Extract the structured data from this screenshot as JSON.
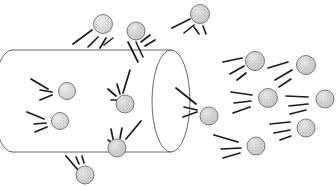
{
  "figure": {
    "canvas": {
      "width": 336,
      "height": 191,
      "background": "#ffffff"
    },
    "colors": {
      "background": "#ffffff",
      "outline": "#555555",
      "stroke": "#1a1a1a",
      "particle_fill": "#d8d8d8",
      "particle_fill_dark": "#c9c9c9",
      "particle_outline": "#555555"
    }
  },
  "cylinder": {
    "name": "cylinder",
    "left_x": 12,
    "right_x": 171,
    "top_y": 50,
    "bottom_y": 152,
    "cap_rx": 19,
    "cap_ry": 51,
    "left_cap_style": "partial-arc",
    "right_cap_style": "full-ellipse",
    "stroke_width": 0.9
  },
  "particles": [
    {
      "id": "p01",
      "cx": 103,
      "cy": 24,
      "r": 9.5,
      "region": "outside-top",
      "shade": "light"
    },
    {
      "id": "p02",
      "cx": 136,
      "cy": 31,
      "r": 9.0,
      "region": "outside-top",
      "shade": "dark"
    },
    {
      "id": "p03",
      "cx": 200,
      "cy": 14,
      "r": 9.5,
      "region": "outside-top",
      "shade": "dark"
    },
    {
      "id": "p04",
      "cx": 67,
      "cy": 91,
      "r": 8.5,
      "region": "inside",
      "shade": "light"
    },
    {
      "id": "p05",
      "cx": 60,
      "cy": 121,
      "r": 8.5,
      "region": "inside",
      "shade": "light"
    },
    {
      "id": "p06",
      "cx": 125,
      "cy": 104,
      "r": 9.0,
      "region": "inside",
      "shade": "dark"
    },
    {
      "id": "p07",
      "cx": 117,
      "cy": 148,
      "r": 9.0,
      "region": "inside",
      "shade": "dark"
    },
    {
      "id": "p08",
      "cx": 85,
      "cy": 175,
      "r": 9.0,
      "region": "outside-bottom",
      "shade": "dark"
    },
    {
      "id": "p09",
      "cx": 209,
      "cy": 116,
      "r": 9.0,
      "region": "outside-right",
      "shade": "dark"
    },
    {
      "id": "p10",
      "cx": 255,
      "cy": 61,
      "r": 9.5,
      "region": "outside-right",
      "shade": "dark"
    },
    {
      "id": "p11",
      "cx": 306,
      "cy": 65,
      "r": 9.5,
      "region": "outside-right",
      "shade": "dark"
    },
    {
      "id": "p12",
      "cx": 268,
      "cy": 98,
      "r": 9.5,
      "region": "outside-right",
      "shade": "dark"
    },
    {
      "id": "p13",
      "cx": 325,
      "cy": 99,
      "r": 9.0,
      "region": "outside-right",
      "shade": "dark"
    },
    {
      "id": "p14",
      "cx": 306,
      "cy": 128,
      "r": 9.0,
      "region": "outside-right",
      "shade": "dark"
    },
    {
      "id": "p15",
      "cx": 256,
      "cy": 146,
      "r": 9.0,
      "region": "outside-right",
      "shade": "dark"
    }
  ],
  "motion_strokes": [
    {
      "x1": 73,
      "y1": 44,
      "x2": 92,
      "y2": 30,
      "w": 1.7
    },
    {
      "x1": 88,
      "y1": 47,
      "x2": 98,
      "y2": 37,
      "w": 1.7
    },
    {
      "x1": 100,
      "y1": 48,
      "x2": 106,
      "y2": 38,
      "w": 1.7
    },
    {
      "x1": 113,
      "y1": 38,
      "x2": 104,
      "y2": 45,
      "w": 1.5
    },
    {
      "x1": 141,
      "y1": 42,
      "x2": 150,
      "y2": 35,
      "w": 1.7
    },
    {
      "x1": 145,
      "y1": 46,
      "x2": 155,
      "y2": 40,
      "w": 1.7
    },
    {
      "x1": 128,
      "y1": 42,
      "x2": 138,
      "y2": 62,
      "w": 1.7
    },
    {
      "x1": 136,
      "y1": 42,
      "x2": 143,
      "y2": 57,
      "w": 1.6
    },
    {
      "x1": 172,
      "y1": 28,
      "x2": 190,
      "y2": 19,
      "w": 1.7
    },
    {
      "x1": 184,
      "y1": 33,
      "x2": 194,
      "y2": 25,
      "w": 1.6
    },
    {
      "x1": 194,
      "y1": 27,
      "x2": 199,
      "y2": 34,
      "w": 1.6
    },
    {
      "x1": 203,
      "y1": 26,
      "x2": 206,
      "y2": 34,
      "w": 1.6
    },
    {
      "x1": 31,
      "y1": 79,
      "x2": 48,
      "y2": 89,
      "w": 1.7
    },
    {
      "x1": 40,
      "y1": 90,
      "x2": 52,
      "y2": 92,
      "w": 1.7
    },
    {
      "x1": 40,
      "y1": 100,
      "x2": 52,
      "y2": 95,
      "w": 1.7
    },
    {
      "x1": 27,
      "y1": 112,
      "x2": 44,
      "y2": 119,
      "w": 1.7
    },
    {
      "x1": 34,
      "y1": 124,
      "x2": 46,
      "y2": 123,
      "w": 1.7
    },
    {
      "x1": 35,
      "y1": 132,
      "x2": 47,
      "y2": 127,
      "w": 1.7
    },
    {
      "x1": 108,
      "y1": 89,
      "x2": 116,
      "y2": 96,
      "w": 1.7
    },
    {
      "x1": 117,
      "y1": 84,
      "x2": 120,
      "y2": 94,
      "w": 1.7
    },
    {
      "x1": 130,
      "y1": 70,
      "x2": 123,
      "y2": 93,
      "w": 1.7
    },
    {
      "x1": 111,
      "y1": 100,
      "x2": 118,
      "y2": 100,
      "w": 1.6
    },
    {
      "x1": 111,
      "y1": 129,
      "x2": 113,
      "y2": 139,
      "w": 1.7
    },
    {
      "x1": 122,
      "y1": 128,
      "x2": 120,
      "y2": 138,
      "w": 1.7
    },
    {
      "x1": 141,
      "y1": 121,
      "x2": 126,
      "y2": 139,
      "w": 1.7
    },
    {
      "x1": 108,
      "y1": 140,
      "x2": 114,
      "y2": 144,
      "w": 1.6
    },
    {
      "x1": 66,
      "y1": 156,
      "x2": 78,
      "y2": 170,
      "w": 1.8
    },
    {
      "x1": 76,
      "y1": 157,
      "x2": 79,
      "y2": 164,
      "w": 1.6
    },
    {
      "x1": 82,
      "y1": 156,
      "x2": 84,
      "y2": 163,
      "w": 1.6
    },
    {
      "x1": 176,
      "y1": 88,
      "x2": 196,
      "y2": 104,
      "w": 1.8
    },
    {
      "x1": 184,
      "y1": 107,
      "x2": 197,
      "y2": 110,
      "w": 1.7
    },
    {
      "x1": 183,
      "y1": 117,
      "x2": 197,
      "y2": 112,
      "w": 1.7
    },
    {
      "x1": 223,
      "y1": 62,
      "x2": 242,
      "y2": 58,
      "w": 1.7
    },
    {
      "x1": 230,
      "y1": 74,
      "x2": 244,
      "y2": 66,
      "w": 1.7
    },
    {
      "x1": 237,
      "y1": 80,
      "x2": 246,
      "y2": 73,
      "w": 1.7
    },
    {
      "x1": 268,
      "y1": 68,
      "x2": 288,
      "y2": 62,
      "w": 1.7
    },
    {
      "x1": 275,
      "y1": 80,
      "x2": 292,
      "y2": 70,
      "w": 1.7
    },
    {
      "x1": 279,
      "y1": 87,
      "x2": 291,
      "y2": 79,
      "w": 1.6
    },
    {
      "x1": 231,
      "y1": 92,
      "x2": 252,
      "y2": 95,
      "w": 1.7
    },
    {
      "x1": 234,
      "y1": 103,
      "x2": 251,
      "y2": 101,
      "w": 1.7
    },
    {
      "x1": 233,
      "y1": 113,
      "x2": 250,
      "y2": 107,
      "w": 1.7
    },
    {
      "x1": 286,
      "y1": 96,
      "x2": 308,
      "y2": 97,
      "w": 1.7
    },
    {
      "x1": 289,
      "y1": 106,
      "x2": 308,
      "y2": 104,
      "w": 1.7
    },
    {
      "x1": 290,
      "y1": 114,
      "x2": 306,
      "y2": 110,
      "w": 1.6
    },
    {
      "x1": 270,
      "y1": 124,
      "x2": 290,
      "y2": 122,
      "w": 1.7
    },
    {
      "x1": 274,
      "y1": 133,
      "x2": 290,
      "y2": 130,
      "w": 1.7
    },
    {
      "x1": 280,
      "y1": 140,
      "x2": 291,
      "y2": 136,
      "w": 1.6
    },
    {
      "x1": 214,
      "y1": 135,
      "x2": 238,
      "y2": 142,
      "w": 1.8
    },
    {
      "x1": 221,
      "y1": 149,
      "x2": 241,
      "y2": 148,
      "w": 1.7
    },
    {
      "x1": 223,
      "y1": 158,
      "x2": 240,
      "y2": 153,
      "w": 1.7
    }
  ]
}
